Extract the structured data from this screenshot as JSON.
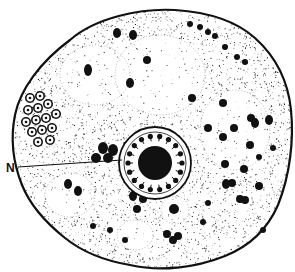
{
  "figure": {
    "style": "stippled ink drawing",
    "colors": {
      "ink": "#111111",
      "background": "#ffffff"
    },
    "labels": [
      {
        "id": "N",
        "text": "N",
        "x": 6,
        "y": 168,
        "target": "nucleus"
      }
    ],
    "cell_outline": "M70,40 C95,18 140,8 175,10 C205,12 235,20 255,38 C275,56 288,80 291,110 C294,140 290,175 278,205 C268,228 250,246 225,256 C195,268 160,272 130,265 C100,260 80,250 65,238 C45,222 30,205 22,185 C14,165 10,140 15,115 C20,90 40,62 70,40 Z",
    "nucleus": {
      "cx": 155,
      "cy": 163,
      "r_outer": 36,
      "r_inner": 28,
      "chromatin_r": 17
    },
    "vacuoles": [
      {
        "cx": 95,
        "cy": 75,
        "rx": 35,
        "ry": 30
      },
      {
        "cx": 160,
        "cy": 75,
        "rx": 45,
        "ry": 40
      },
      {
        "cx": 235,
        "cy": 130,
        "rx": 35,
        "ry": 40
      },
      {
        "cx": 70,
        "cy": 195,
        "rx": 25,
        "ry": 22
      },
      {
        "cx": 175,
        "cy": 210,
        "rx": 14,
        "ry": 14
      },
      {
        "cx": 135,
        "cy": 235,
        "rx": 18,
        "ry": 15
      }
    ],
    "ring_granules_region": {
      "cx": 45,
      "cy": 115,
      "count": 14
    },
    "granules": [
      [
        117,
        33,
        4,
        5
      ],
      [
        133,
        35,
        4,
        5
      ],
      [
        147,
        60,
        4,
        4
      ],
      [
        130,
        83,
        4,
        5
      ],
      [
        88,
        70,
        4,
        6
      ],
      [
        190,
        24,
        3,
        3
      ],
      [
        200,
        27,
        3,
        3
      ],
      [
        208,
        32,
        3,
        3
      ],
      [
        215,
        36,
        3,
        3
      ],
      [
        225,
        47,
        3,
        3
      ],
      [
        237,
        57,
        3,
        3
      ],
      [
        245,
        62,
        3,
        3
      ],
      [
        192,
        98,
        4,
        4
      ],
      [
        223,
        103,
        4,
        4
      ],
      [
        251,
        118,
        4,
        4
      ],
      [
        234,
        128,
        4,
        4
      ],
      [
        208,
        128,
        4,
        4
      ],
      [
        223,
        137,
        4,
        4
      ],
      [
        250,
        145,
        4,
        4
      ],
      [
        225,
        164,
        4,
        4
      ],
      [
        244,
        169,
        4,
        4
      ],
      [
        232,
        183,
        4,
        4
      ],
      [
        259,
        186,
        4,
        4
      ],
      [
        240,
        199,
        4,
        4
      ],
      [
        255,
        123,
        4,
        5
      ],
      [
        269,
        120,
        4,
        5
      ],
      [
        259,
        157,
        3,
        3
      ],
      [
        273,
        148,
        3,
        3
      ],
      [
        68,
        184,
        4,
        5
      ],
      [
        78,
        191,
        4,
        5
      ],
      [
        133,
        196,
        4,
        5
      ],
      [
        143,
        199,
        4,
        4
      ],
      [
        137,
        209,
        4,
        4
      ],
      [
        174,
        209,
        5,
        5
      ],
      [
        167,
        234,
        4,
        4
      ],
      [
        178,
        236,
        4,
        4
      ],
      [
        173,
        240,
        4,
        4
      ],
      [
        226,
        184,
        4,
        5
      ],
      [
        245,
        200,
        4,
        4
      ],
      [
        263,
        230,
        3,
        3
      ],
      [
        208,
        203,
        3,
        3
      ],
      [
        103,
        148,
        5,
        6
      ],
      [
        113,
        150,
        5,
        6
      ],
      [
        96,
        158,
        5,
        5
      ],
      [
        108,
        158,
        5,
        5
      ],
      [
        110,
        230,
        3,
        3
      ],
      [
        125,
        240,
        3,
        3
      ],
      [
        203,
        222,
        3,
        3
      ],
      [
        93,
        226,
        3,
        3
      ]
    ]
  }
}
